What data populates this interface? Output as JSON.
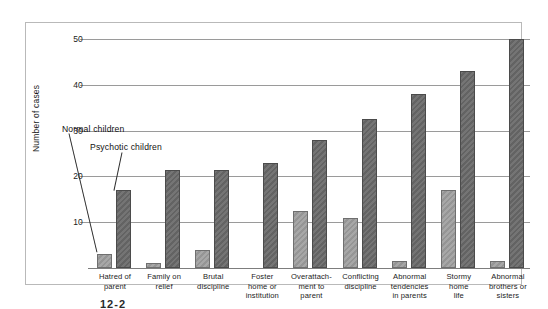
{
  "chart_data": {
    "type": "bar",
    "title": "",
    "xlabel": "",
    "ylabel": "Number of cases",
    "ylim": [
      0,
      52
    ],
    "yticks": [
      10,
      20,
      30,
      40,
      50
    ],
    "grid": true,
    "legend_position": "inline-annotation",
    "categories": [
      "Hatred of parent",
      "Family on relief",
      "Brutal discipline",
      "Foster home or institution",
      "Overattachment to parent",
      "Conflicting discipline",
      "Abnormal tendencies in parents",
      "Stormy home life",
      "Abnormal brothers or sisters"
    ],
    "category_lines": [
      [
        "Hatred of",
        "parent"
      ],
      [
        "Family on",
        "relief"
      ],
      [
        "Brutal",
        "discipline"
      ],
      [
        "Foster",
        "home or",
        "institution"
      ],
      [
        "Overattach-",
        "ment to",
        "parent"
      ],
      [
        "Conflicting",
        "discipline"
      ],
      [
        "Abnormal",
        "tendencies",
        "in parents"
      ],
      [
        "Stormy",
        "home",
        "life"
      ],
      [
        "Abnormal",
        "brothers or",
        "sisters"
      ]
    ],
    "series": [
      {
        "name": "Normal children",
        "color": "#9d9d9d",
        "values": [
          3,
          1,
          4,
          0,
          12.5,
          11,
          1.5,
          17,
          1.5
        ]
      },
      {
        "name": "Psychotic children",
        "color": "#6a6a6a",
        "values": [
          17,
          21.5,
          21.5,
          23,
          28,
          32.5,
          38,
          43,
          50
        ]
      }
    ]
  },
  "annotations": {
    "normal_children": "Normal children",
    "psychotic_children": "Psychotic children"
  },
  "caption": "12-2",
  "colors": {
    "normal_bar": "#9d9d9d",
    "psychotic_bar": "#6a6a6a",
    "gridline": "#9a9a9a",
    "frame": "#b9b9b9",
    "text": "#1b1b1b"
  }
}
